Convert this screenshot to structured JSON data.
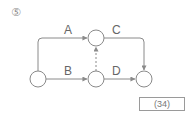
{
  "question": {
    "number": "⑤"
  },
  "diagram": {
    "type": "activity-network",
    "nodes": [
      {
        "id": "n1",
        "x": 38,
        "y": 79
      },
      {
        "id": "n2",
        "x": 96,
        "y": 38
      },
      {
        "id": "n3",
        "x": 96,
        "y": 79
      },
      {
        "id": "n4",
        "x": 144,
        "y": 79
      }
    ],
    "edges": [
      {
        "label": "A",
        "from": "n1",
        "to": "n2",
        "style": "solid"
      },
      {
        "label": "B",
        "from": "n1",
        "to": "n3",
        "style": "solid"
      },
      {
        "label": "C",
        "from": "n2",
        "to": "n4",
        "style": "solid"
      },
      {
        "label": "D",
        "from": "n3",
        "to": "n4",
        "style": "solid"
      },
      {
        "label": "",
        "from": "n3",
        "to": "n2",
        "style": "dashed"
      }
    ],
    "labels": {
      "a": "A",
      "b": "B",
      "c": "C",
      "d": "D"
    }
  },
  "answer_box": {
    "label": "(34)"
  },
  "colors": {
    "line": "#8a8a8a",
    "text": "#666666"
  }
}
